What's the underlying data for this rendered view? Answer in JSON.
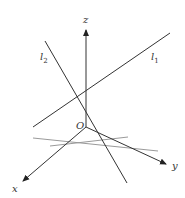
{
  "diagram": {
    "type": "3d-coordinate-skew-lines",
    "axes": {
      "x_label": "x",
      "y_label": "y",
      "z_label": "z",
      "origin_label": "O"
    },
    "lines": [
      {
        "name": "l1",
        "label_base": "l",
        "label_sub": "1"
      },
      {
        "name": "l2",
        "label_base": "l",
        "label_sub": "2"
      }
    ],
    "colors": {
      "line": "#333333",
      "plane_lines": "#9a9a9a",
      "background": "#ffffff"
    }
  }
}
